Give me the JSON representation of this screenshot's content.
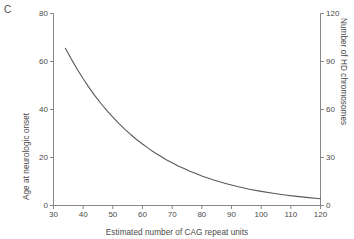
{
  "panel": {
    "letter": "C"
  },
  "chart_data": {
    "type": "line",
    "title": "",
    "xlabel": "Estimated number of CAG repeat units",
    "ylabel": "Age at neurologic onset",
    "y2label": "Number of HD chromosomes",
    "xlim": [
      30,
      120
    ],
    "ylim": [
      0,
      80
    ],
    "y2lim": [
      0,
      120
    ],
    "grid": false,
    "legend": null,
    "xticks": [
      30,
      40,
      50,
      60,
      70,
      80,
      90,
      100,
      110,
      120
    ],
    "xticklabels": [
      "30",
      "40",
      "50",
      "60",
      "70",
      "80",
      "90",
      "100",
      "110",
      "120"
    ],
    "yticks": [
      0,
      20,
      40,
      60,
      80
    ],
    "yticklabels": [
      "0",
      "20",
      "40",
      "60",
      "80"
    ],
    "y2ticks": [
      0,
      30,
      60,
      90,
      120
    ],
    "y2ticklabels": [
      "0",
      "30",
      "60",
      "90",
      "120"
    ],
    "series": [
      {
        "name": "Age at neurologic onset",
        "axis": "left",
        "color": "#595959",
        "x": [
          34,
          36,
          38,
          40,
          42,
          44,
          46,
          48,
          50,
          52,
          54,
          56,
          58,
          60,
          62,
          64,
          66,
          68,
          70,
          72,
          74,
          76,
          78,
          80,
          84,
          88,
          92,
          96,
          100,
          104,
          108,
          112,
          116,
          120
        ],
        "y": [
          65.5,
          61.0,
          56.8,
          52.8,
          49.1,
          45.7,
          42.5,
          39.5,
          36.8,
          34.2,
          31.8,
          29.6,
          27.5,
          25.6,
          23.8,
          22.1,
          20.6,
          19.1,
          17.8,
          16.5,
          15.4,
          14.3,
          13.3,
          12.3,
          10.6,
          9.2,
          7.9,
          6.8,
          5.9,
          5.1,
          4.4,
          3.8,
          3.3,
          2.8
        ]
      }
    ]
  },
  "axis_color": "#7a7a7a",
  "curve_color": "#595959"
}
